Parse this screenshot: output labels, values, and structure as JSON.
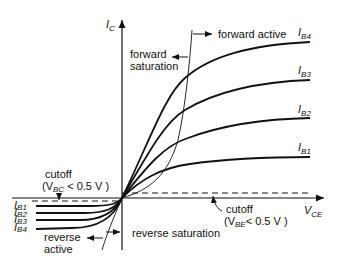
{
  "diagram": {
    "axes": {
      "y_label": "I",
      "y_sub": "C",
      "x_label": "V",
      "x_sub": "CE"
    },
    "curves": [
      {
        "label": "I",
        "sub": "B4"
      },
      {
        "label": "I",
        "sub": "B3"
      },
      {
        "label": "I",
        "sub": "B2"
      },
      {
        "label": "I",
        "sub": "B1"
      }
    ],
    "reverse_curves": [
      {
        "label": "I",
        "sub": "B1"
      },
      {
        "label": "I",
        "sub": "B2"
      },
      {
        "label": "I",
        "sub": "B3"
      },
      {
        "label": "I",
        "sub": "B4"
      }
    ],
    "regions": {
      "forward_active": "forward active",
      "forward_saturation_1": "forward",
      "forward_saturation_2": "saturation",
      "reverse_active_1": "reverse",
      "reverse_active_2": "active",
      "reverse_saturation": "reverse saturation",
      "cutoff_bc": "cutoff",
      "cutoff_bc_cond_pre": "(V",
      "cutoff_bc_cond_sub": "BC",
      "cutoff_bc_cond_post": " < 0.5 V )",
      "cutoff_be": "cutoff",
      "cutoff_be_cond_pre": "(V",
      "cutoff_be_cond_sub": "BE",
      "cutoff_be_cond_post": "< 0.5 V )"
    },
    "colors": {
      "line": "#111111",
      "background": "#ffffff"
    }
  }
}
